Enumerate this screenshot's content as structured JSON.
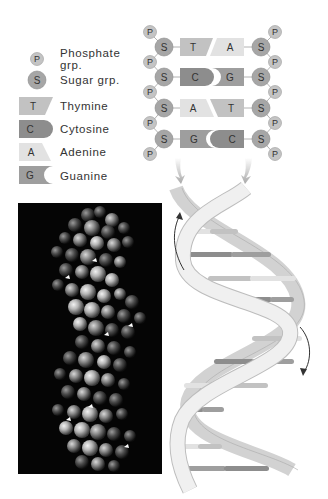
{
  "legend": {
    "items": [
      {
        "symbol": "P",
        "label_line1": "Phosphate",
        "label_line2": "grp.",
        "shape": "circle-small",
        "color": "#c4c4c4"
      },
      {
        "symbol": "S",
        "label_line1": "Sugar grp.",
        "shape": "circle",
        "color": "#a6a6a6"
      },
      {
        "symbol": "T",
        "label_line1": "Thymine",
        "shape": "slant-right",
        "color": "#c2c2c2"
      },
      {
        "symbol": "C",
        "label_line1": "Cytosine",
        "shape": "rounded-right",
        "color": "#8d8d8d"
      },
      {
        "symbol": "A",
        "label_line1": "Adenine",
        "shape": "slant-left",
        "color": "#e2e2e2"
      },
      {
        "symbol": "G",
        "label_line1": "Guanine",
        "shape": "notch-right",
        "color": "#9e9e9e"
      }
    ]
  },
  "ladder": {
    "rows": [
      {
        "left_sugar": "S",
        "left_base": "T",
        "right_base": "A",
        "right_sugar": "S"
      },
      {
        "left_sugar": "S",
        "left_base": "C",
        "right_base": "G",
        "right_sugar": "S"
      },
      {
        "left_sugar": "S",
        "left_base": "A",
        "right_base": "T",
        "right_sugar": "S"
      },
      {
        "left_sugar": "S",
        "left_base": "G",
        "right_base": "C",
        "right_sugar": "S"
      }
    ],
    "phosphate": "P"
  },
  "colors": {
    "phosphate": "#c4c4c4",
    "sugar": "#a6a6a6",
    "thymine": "#c2c2c2",
    "cytosine": "#8d8d8d",
    "adenine": "#e2e2e2",
    "guanine": "#9e9e9e",
    "strand_front": "#ececec",
    "strand_back": "#cfcfcf",
    "photo_bg": "#050505"
  },
  "photo": {
    "description": "space-filling molecular model of DNA double helix"
  },
  "helix": {
    "rotation_arrows": 2,
    "rungs": 10
  }
}
